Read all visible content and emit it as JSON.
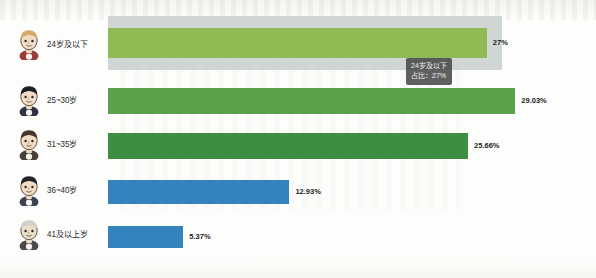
{
  "chart_data": {
    "type": "bar",
    "orientation": "horizontal",
    "title": "",
    "xlabel": "",
    "ylabel": "",
    "categories": [
      "24岁及以下",
      "25~30岁",
      "31~35岁",
      "36~40岁",
      "41及以上岁"
    ],
    "values": [
      27.0,
      29.03,
      25.66,
      12.93,
      5.37
    ],
    "value_labels": [
      "27%",
      "29.03%",
      "25.66%",
      "12.93%",
      "5.37%"
    ],
    "bar_colors": [
      "#8fba54",
      "#5ca04a",
      "#3e8e41",
      "#3483bc",
      "#3483bc"
    ],
    "xlim": [
      0,
      31
    ],
    "grid": false,
    "legend": null,
    "highlighted_index": 0,
    "highlight_color": "#c8cfcb"
  },
  "tooltip": {
    "visible": true,
    "category_line": "24岁及以下",
    "value_line": "占比：27%",
    "background": "#4a4a4a"
  },
  "avatars": [
    {
      "name": "avatar-young-adult",
      "hair": "#d9a96a",
      "skin": "#f2dcc4",
      "shirt": "#9c3a38"
    },
    {
      "name": "avatar-man-suit",
      "hair": "#1d1d22",
      "skin": "#f2dcc4",
      "shirt": "#2d3340"
    },
    {
      "name": "avatar-woman-longhair",
      "hair": "#4a352a",
      "skin": "#f2dcc4",
      "shirt": "#49403a"
    },
    {
      "name": "avatar-middle-aged-man",
      "hair": "#23252b",
      "skin": "#f2dcc4",
      "shirt": "#3c4450"
    },
    {
      "name": "avatar-elderly-man",
      "hair": "#cfcfcb",
      "skin": "#eadfc8",
      "shirt": "#4a4a4a"
    }
  ]
}
